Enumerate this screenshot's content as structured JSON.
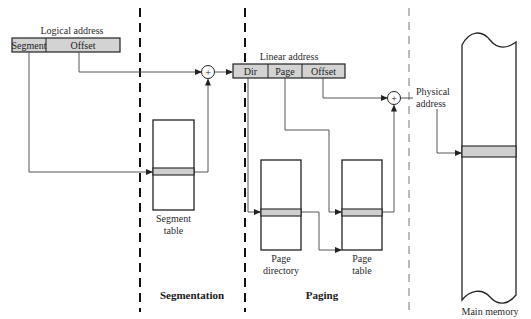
{
  "logical_address": {
    "title": "Logical address",
    "fields": [
      "Segment",
      "Offset"
    ]
  },
  "linear_address": {
    "title": "Linear address",
    "fields": [
      "Dir",
      "Page",
      "Offset"
    ]
  },
  "adders": {
    "symbol": "+"
  },
  "tables": {
    "segment_table": [
      "Segment",
      "table"
    ],
    "page_directory": [
      "Page",
      "directory"
    ],
    "page_table": [
      "Page",
      "table"
    ],
    "main_memory": "Main memory"
  },
  "physical_address": [
    "Physical",
    "address"
  ],
  "sections": {
    "segmentation": "Segmentation",
    "paging": "Paging"
  },
  "colors": {
    "shaded_entry": "#cfcfcf",
    "address_field": "#d3d3d3",
    "line": "#222222"
  }
}
